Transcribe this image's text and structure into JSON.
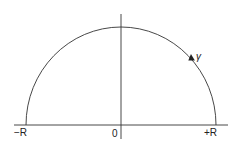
{
  "diagram": {
    "labels": {
      "left_endpoint": "−R",
      "origin": "0",
      "right_endpoint": "+R",
      "contour": "γ"
    },
    "colors": {
      "stroke": "#333333",
      "text": "#222222",
      "background": "#ffffff"
    }
  }
}
